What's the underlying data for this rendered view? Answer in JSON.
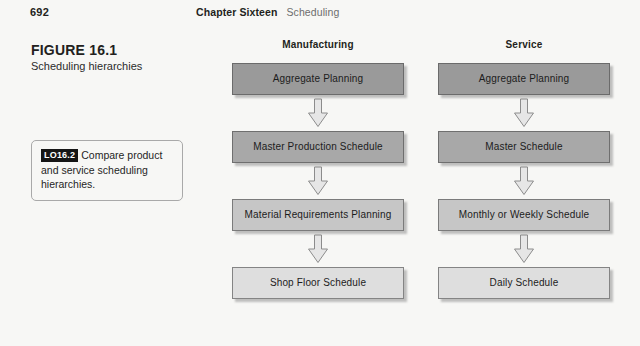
{
  "page": {
    "folio": "692",
    "chapter": "Chapter Sixteen",
    "subject": "Scheduling"
  },
  "figure": {
    "number": "FIGURE 16.1",
    "caption": "Scheduling hierarchies"
  },
  "learning_objective": {
    "badge": "LO16.2",
    "text": "Compare product and service scheduling hierarchies."
  },
  "columns": [
    {
      "id": "manufacturing",
      "title": "Manufacturing",
      "boxes": [
        {
          "label": "Aggregate Planning",
          "tone": "#9a9a9a"
        },
        {
          "label": "Master Production Schedule",
          "tone": "#a8a8a8"
        },
        {
          "label": "Material Requirements Planning",
          "tone": "#c6c6c6"
        },
        {
          "label": "Shop Floor Schedule",
          "tone": "#dedede"
        }
      ]
    },
    {
      "id": "service",
      "title": "Service",
      "boxes": [
        {
          "label": "Aggregate Planning",
          "tone": "#9a9a9a"
        },
        {
          "label": "Master Schedule",
          "tone": "#a8a8a8"
        },
        {
          "label": "Monthly or Weekly Schedule",
          "tone": "#c6c6c6"
        },
        {
          "label": "Daily Schedule",
          "tone": "#dedede"
        }
      ]
    }
  ],
  "arrow": {
    "name": "down-block-arrow",
    "fill": "#e6e6e6",
    "stroke": "#8c8c8c"
  },
  "colors": {
    "page_background": "#f7f7f5",
    "text": "#231f20",
    "muted_text": "#6d6d6d",
    "badge_background": "#151515",
    "badge_text": "#ffffff"
  }
}
